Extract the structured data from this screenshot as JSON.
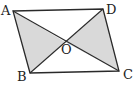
{
  "figure": {
    "type": "parallelogram-with-diagonals",
    "vertices": {
      "A": {
        "label": "A",
        "x": 13,
        "y": 11,
        "label_x": 1,
        "label_y": 15
      },
      "B": {
        "label": "B",
        "x": 30,
        "y": 73,
        "label_x": 17,
        "label_y": 81
      },
      "C": {
        "label": "C",
        "x": 119,
        "y": 71,
        "label_x": 123,
        "label_y": 79
      },
      "D": {
        "label": "D",
        "x": 103,
        "y": 9,
        "label_x": 106,
        "label_y": 14
      }
    },
    "intersection": {
      "label": "O",
      "x": 65,
      "y": 42,
      "label_x": 61,
      "label_y": 54
    },
    "shaded_regions": [
      "AOB",
      "DOC"
    ],
    "colors": {
      "stroke": "#2a2a2a",
      "shade": "#d9d9d9",
      "background": "#ffffff"
    }
  }
}
